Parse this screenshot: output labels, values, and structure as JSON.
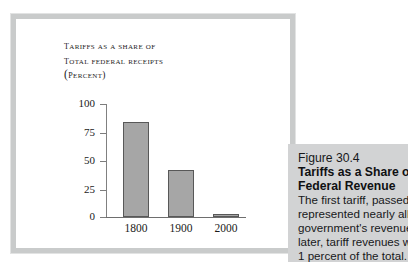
{
  "figure": {
    "frame_color": "#c9cbcb",
    "panel_background": "#ffffff"
  },
  "chart_title": {
    "line1": "Tariffs as a share of",
    "line2": "total federal receipts",
    "line3": "(percent)"
  },
  "caption": {
    "figure_number": "Figure 30.4",
    "title_line1": "Tariffs as a Share of",
    "title_line2": "Federal Revenue",
    "body_line1": "The first tariff, passed",
    "body_line2": "represented nearly all",
    "body_line3": "government's revenue",
    "body_line4": "later, tariff revenues w",
    "body_line5": "1 percent of the total.",
    "background_color": "#d2d3d4"
  },
  "chart_data": {
    "type": "bar",
    "title": "Tariffs as a share of total federal receipts (percent)",
    "categories": [
      "1800",
      "1900",
      "2000"
    ],
    "values": [
      83,
      41,
      3
    ],
    "xlabel": "",
    "ylabel": "percent",
    "ylim": [
      0,
      100
    ],
    "yticks": [
      0,
      25,
      50,
      75,
      100
    ],
    "ytick_labels": [
      "0",
      "25",
      "50",
      "75",
      "100"
    ],
    "grid": false,
    "legend": false,
    "bar_fill_color": "#a6a6a6",
    "bar_edge_color": "#585858"
  }
}
